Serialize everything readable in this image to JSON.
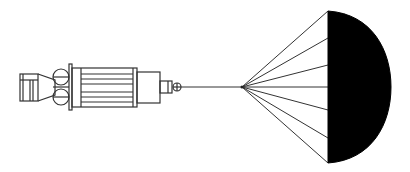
{
  "diagram": {
    "parts": [
      {
        "id": "engine-nozzle",
        "label": "Engine nozzle"
      },
      {
        "id": "propellant-tanks",
        "label": "Spherical tanks"
      },
      {
        "id": "flange",
        "label": "Mounting flange"
      },
      {
        "id": "main-body",
        "label": "Main body"
      },
      {
        "id": "upper-module",
        "label": "Upper module"
      },
      {
        "id": "connector",
        "label": "Connector"
      },
      {
        "id": "tether",
        "label": "Tether line"
      },
      {
        "id": "parachute",
        "label": "Parachute canopy"
      }
    ],
    "colors": {
      "stroke": "#333333",
      "canopy_fill": "#000000",
      "background": "#ffffff"
    },
    "parachute": {
      "apex": [
        242,
        87
      ],
      "canopy_x": 328,
      "canopy_top": 11,
      "canopy_bottom": 163,
      "canopy_right": 391,
      "shroud_line_ends_y": [
        11,
        38,
        65,
        87,
        110,
        138,
        163
      ]
    }
  }
}
